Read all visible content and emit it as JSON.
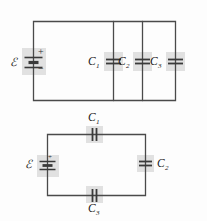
{
  "figure": {
    "background_color": "#fdfdfd",
    "wire_color": "#4a4a4a",
    "plate_color": "#3a3a3a",
    "highlight_color": "#d8d8d8"
  },
  "circuits": [
    {
      "id": "parallel-circuit",
      "description": "Three capacitors in parallel across an emf source",
      "topology": "parallel",
      "source": {
        "symbol": "emf-source",
        "label": "ℰ",
        "plus_sign": "+",
        "minus_sign": "−"
      },
      "capacitors": [
        {
          "name": "C",
          "subscript": "1",
          "orientation": "vertical-wire-horizontal-plates"
        },
        {
          "name": "C",
          "subscript": "2",
          "orientation": "vertical-wire-horizontal-plates"
        },
        {
          "name": "C",
          "subscript": "3",
          "orientation": "vertical-wire-horizontal-plates"
        }
      ]
    },
    {
      "id": "series-circuit",
      "description": "Three capacitors in series with an emf source",
      "topology": "series",
      "source": {
        "symbol": "emf-source",
        "label": "ℰ",
        "plus_sign": "+",
        "minus_sign": "−"
      },
      "capacitors": [
        {
          "name": "C",
          "subscript": "1",
          "orientation": "horizontal-wire-vertical-plates",
          "position": "top"
        },
        {
          "name": "C",
          "subscript": "2",
          "orientation": "vertical-wire-horizontal-plates",
          "position": "right"
        },
        {
          "name": "C",
          "subscript": "3",
          "orientation": "horizontal-wire-vertical-plates",
          "position": "bottom"
        }
      ]
    }
  ]
}
